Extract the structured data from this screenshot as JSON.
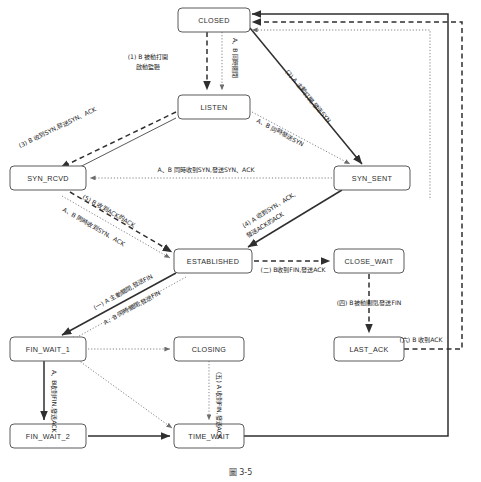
{
  "figure": {
    "caption": "圖 3-5"
  },
  "states": [
    {
      "id": "closed",
      "label": "CLOSED",
      "x": 178,
      "y": 8,
      "w": 72,
      "h": 24
    },
    {
      "id": "listen",
      "label": "LISTEN",
      "x": 178,
      "y": 95,
      "w": 72,
      "h": 24
    },
    {
      "id": "syn_rcvd",
      "label": "SYN_RCVD",
      "x": 10,
      "y": 166,
      "w": 76,
      "h": 24
    },
    {
      "id": "syn_sent",
      "label": "SYN_SENT",
      "x": 334,
      "y": 166,
      "w": 76,
      "h": 24
    },
    {
      "id": "established",
      "label": "ESTABLISHED",
      "x": 174,
      "y": 249,
      "w": 78,
      "h": 24
    },
    {
      "id": "close_wait",
      "label": "CLOSE_WAIT",
      "x": 334,
      "y": 249,
      "w": 70,
      "h": 24
    },
    {
      "id": "last_ack",
      "label": "LAST_ACK",
      "x": 334,
      "y": 337,
      "w": 70,
      "h": 24
    },
    {
      "id": "fin_wait_1",
      "label": "FIN_WAIT_1",
      "x": 10,
      "y": 337,
      "w": 76,
      "h": 24
    },
    {
      "id": "closing",
      "label": "CLOSING",
      "x": 174,
      "y": 337,
      "w": 70,
      "h": 24
    },
    {
      "id": "fin_wait_2",
      "label": "FIN_WAIT_2",
      "x": 10,
      "y": 424,
      "w": 76,
      "h": 24
    },
    {
      "id": "time_wait",
      "label": "TIME_WAIT",
      "x": 174,
      "y": 424,
      "w": 70,
      "h": 24
    }
  ],
  "transitions": [
    {
      "id": "t1",
      "from": "closed",
      "to": "listen",
      "label": "(1) B 被動打開",
      "label2": "啟動監聽",
      "style": "dashed"
    },
    {
      "id": "t_close_sim",
      "from": "time_wait",
      "to": "closed",
      "label": "A、B 同時關閉",
      "style": "dotted"
    },
    {
      "id": "t2",
      "from": "closed",
      "to": "syn_sent",
      "label": "(2) A 主動打開,發送SYN",
      "style": "solid"
    },
    {
      "id": "t3",
      "from": "listen",
      "to": "syn_rcvd",
      "label": "(3) B 收到SYN,發送SYN、ACK",
      "style": "dashed"
    },
    {
      "id": "t_sim_syn",
      "from": "listen",
      "to": "syn_sent",
      "label": "A、B 同時發送SYN",
      "style": "dotted"
    },
    {
      "id": "t_sim_recv_syn",
      "from": "syn_sent",
      "to": "syn_rcvd",
      "label": "A、B 同時收到SYN,發送SYN、ACK",
      "style": "dotted"
    },
    {
      "id": "t4",
      "from": "syn_sent",
      "to": "established",
      "label": "(4) A 收到SYN、ACK,",
      "label2": "發送ACK的ACK",
      "style": "solid"
    },
    {
      "id": "t5",
      "from": "syn_rcvd",
      "to": "established",
      "label": "(5) B 收到ACK的ACK",
      "style": "dashed"
    },
    {
      "id": "t_sim_recv_synack",
      "from": "syn_rcvd",
      "to": "established",
      "label": "A、B 同時收到SYN、ACK",
      "style": "dotted"
    },
    {
      "id": "t_c1",
      "from": "established",
      "to": "fin_wait_1",
      "label": "(一) A 主動關閉,發送FIN",
      "style": "solid"
    },
    {
      "id": "t_sim_close",
      "from": "established",
      "to": "fin_wait_1",
      "label": "A、B 同時關閉,發送FIN",
      "style": "dotted"
    },
    {
      "id": "t_c2",
      "from": "established",
      "to": "close_wait",
      "label": "(二) B收到FIN,發送ACK",
      "style": "dashed"
    },
    {
      "id": "t_c4",
      "from": "close_wait",
      "to": "last_ack",
      "label": "(四) B被動關閉,發送FIN",
      "style": "dashed"
    },
    {
      "id": "t_c6",
      "from": "last_ack",
      "to": "closed",
      "label": "(六) B 收到ACK",
      "style": "dashed"
    },
    {
      "id": "t_c3",
      "from": "fin_wait_1",
      "to": "fin_wait_2",
      "label": "(三) A 收到ACK",
      "style": "solid"
    },
    {
      "id": "t_fin_closing",
      "from": "fin_wait_1",
      "to": "closing",
      "label": "A、B收到FIN,發送ACK",
      "style": "dotted"
    },
    {
      "id": "t_fw1_tw",
      "from": "fin_wait_1",
      "to": "time_wait",
      "label": "",
      "style": "dotted"
    },
    {
      "id": "t_closing_tw",
      "from": "closing",
      "to": "time_wait",
      "label": "A、B 收到ACK",
      "style": "dotted"
    },
    {
      "id": "t_c5",
      "from": "fin_wait_2",
      "to": "time_wait",
      "label": "(五) A 收到FIN,發送ACK",
      "style": "solid"
    },
    {
      "id": "t_tw_closed",
      "from": "time_wait",
      "to": "closed",
      "label": "",
      "style": "solid"
    }
  ]
}
